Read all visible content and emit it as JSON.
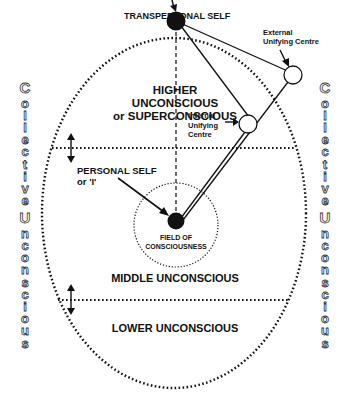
{
  "diagram": {
    "labels": {
      "transpersonal_self": "TRANSPERSONAL SELF",
      "higher_line1": "HIGHER UNCONSCIOUS",
      "higher_line2": "or SUPERCONSCIOUS",
      "external_line1": "External",
      "external_line2": "Unifying Centre",
      "internal_line1": "Internal",
      "internal_line2": "Unifying",
      "internal_line3": "Centre",
      "personal_self_line1": "PERSONAL SELF",
      "personal_self_line2": "or 'I'",
      "field_line1": "FIELD OF",
      "field_line2": "CONSCIOUSNESS",
      "middle": "MIDDLE UNCONSCIOUS",
      "lower": "LOWER UNCONSCIOUS"
    },
    "side_text": {
      "left": [
        "C",
        "o",
        "l",
        "l",
        "e",
        "c",
        "t",
        "i",
        "v",
        "e",
        " ",
        "U",
        "n",
        "c",
        "o",
        "n",
        "s",
        "c",
        "i",
        "o",
        "u",
        "s"
      ],
      "right": [
        "C",
        "o",
        "l",
        "l",
        "e",
        "c",
        "t",
        "i",
        "v",
        "e",
        " ",
        "U",
        "n",
        "c",
        "o",
        "n",
        "s",
        "c",
        "i",
        "o",
        "u",
        "s"
      ],
      "full": "Collective Unconscious"
    },
    "colors": {
      "ink": "#111111",
      "background": "#ffffff"
    }
  }
}
